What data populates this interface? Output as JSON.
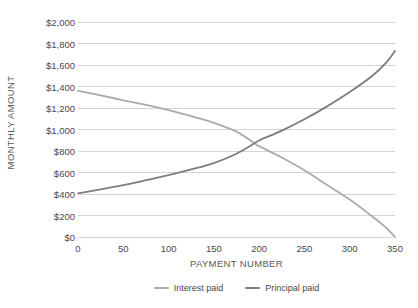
{
  "chart_data": {
    "type": "line",
    "title": "",
    "xlabel": "PAYMENT NUMBER",
    "ylabel": "MONTHLY AMOUNT",
    "xlim": [
      0,
      350
    ],
    "ylim": [
      0,
      2000
    ],
    "grid": "horizontal",
    "legend_position": "bottom",
    "x_ticks": [
      0,
      50,
      100,
      150,
      200,
      250,
      300,
      350
    ],
    "x_tick_labels": [
      "0",
      "50",
      "100",
      "150",
      "200",
      "250",
      "300",
      "350"
    ],
    "y_ticks": [
      0,
      200,
      400,
      600,
      800,
      1000,
      1200,
      1400,
      1600,
      1800,
      2000
    ],
    "y_tick_labels": [
      "$0",
      "$200",
      "$400",
      "$600",
      "$800",
      "$1,000",
      "$1,200",
      "$1,400",
      "$1,600",
      "$1,800",
      "$2,000"
    ],
    "x": [
      0,
      25,
      50,
      75,
      100,
      125,
      150,
      175,
      195,
      200,
      225,
      250,
      275,
      300,
      325,
      340,
      350
    ],
    "series": [
      {
        "name": "Interest paid",
        "color": "#ababab",
        "values": [
          1360,
          1318,
          1272,
          1228,
          1180,
          1124,
          1062,
          980,
          872,
          845,
          740,
          620,
          484,
          348,
          190,
          88,
          0
        ]
      },
      {
        "name": "Principal paid",
        "color": "#7d7d7d",
        "values": [
          405,
          443,
          483,
          528,
          575,
          628,
          688,
          775,
          872,
          898,
          990,
          1095,
          1215,
          1348,
          1500,
          1620,
          1730
        ]
      }
    ],
    "annotations": []
  },
  "legend": {
    "items": [
      {
        "label": "Interest paid",
        "color": "#ababab"
      },
      {
        "label": "Principal paid",
        "color": "#7d7d7d"
      }
    ]
  },
  "axes": {
    "y_title": "MONTHLY AMOUNT",
    "x_title": "PAYMENT NUMBER"
  },
  "style": {
    "background": "#ffffff",
    "gridline_color": "#d4d4d4",
    "tick_label_color": "#4a4a4c",
    "axis_title_color": "#58585a"
  }
}
